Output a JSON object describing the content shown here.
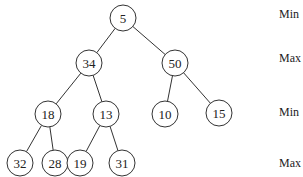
{
  "diagram": {
    "level_labels": [
      "Min",
      "Max",
      "Min",
      "Max"
    ],
    "nodes": [
      {
        "id": "n0",
        "value": "5",
        "level": 0
      },
      {
        "id": "n1",
        "value": "34",
        "level": 1
      },
      {
        "id": "n2",
        "value": "50",
        "level": 1
      },
      {
        "id": "n3",
        "value": "18",
        "level": 2
      },
      {
        "id": "n4",
        "value": "13",
        "level": 2
      },
      {
        "id": "n5",
        "value": "10",
        "level": 2
      },
      {
        "id": "n6",
        "value": "15",
        "level": 2
      },
      {
        "id": "n7",
        "value": "32",
        "level": 3
      },
      {
        "id": "n8",
        "value": "28",
        "level": 3
      },
      {
        "id": "n9",
        "value": "19",
        "level": 3
      },
      {
        "id": "n10",
        "value": "31",
        "level": 3
      }
    ],
    "edges": [
      [
        "n0",
        "n1"
      ],
      [
        "n0",
        "n2"
      ],
      [
        "n1",
        "n3"
      ],
      [
        "n1",
        "n4"
      ],
      [
        "n2",
        "n5"
      ],
      [
        "n2",
        "n6"
      ],
      [
        "n3",
        "n7"
      ],
      [
        "n3",
        "n8"
      ],
      [
        "n4",
        "n9"
      ],
      [
        "n4",
        "n10"
      ]
    ]
  }
}
